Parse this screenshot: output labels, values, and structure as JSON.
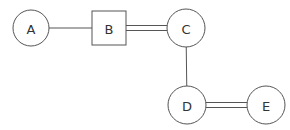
{
  "diagram": {
    "type": "graph",
    "nodes": [
      {
        "id": "A",
        "label": "A",
        "shape": "circle"
      },
      {
        "id": "B",
        "label": "B",
        "shape": "square"
      },
      {
        "id": "C",
        "label": "C",
        "shape": "circle"
      },
      {
        "id": "D",
        "label": "D",
        "shape": "circle"
      },
      {
        "id": "E",
        "label": "E",
        "shape": "circle"
      }
    ],
    "edges": [
      {
        "from": "A",
        "to": "B",
        "style": "single"
      },
      {
        "from": "B",
        "to": "C",
        "style": "double"
      },
      {
        "from": "C",
        "to": "D",
        "style": "single"
      },
      {
        "from": "D",
        "to": "E",
        "style": "double"
      }
    ],
    "colors": {
      "stroke": "#555555",
      "text": "#333333",
      "background": "#ffffff"
    }
  }
}
